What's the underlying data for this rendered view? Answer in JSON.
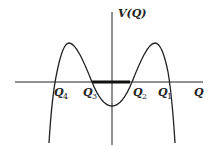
{
  "diagram": {
    "title": "",
    "y_axis_label": "V(Q)",
    "x_axis_label": "Q",
    "roots": [
      {
        "name": "Q",
        "subscript": "4"
      },
      {
        "name": "Q",
        "subscript": "3"
      },
      {
        "name": "Q",
        "subscript": "2"
      },
      {
        "name": "Q",
        "subscript": "1"
      }
    ],
    "highlight": "thick segment on Q-axis between Q3 and Q2",
    "curve": "double-well potential: two maxima above axis, local minimum below axis at Q=0, tails descending to -infinity",
    "colors": {
      "line": "#222222",
      "background": "#ffffff"
    }
  }
}
